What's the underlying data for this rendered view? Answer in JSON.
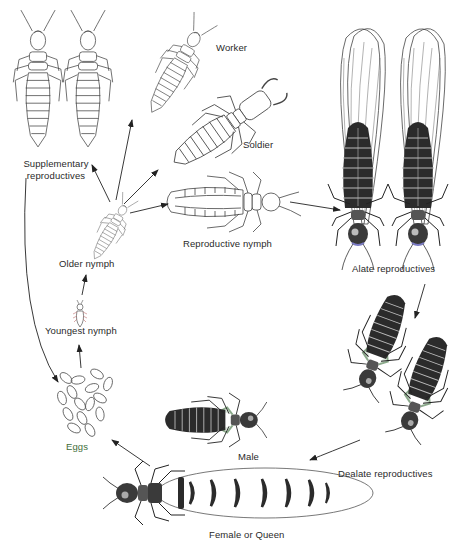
{
  "diagram": {
    "colors": {
      "line": "#333333",
      "dark_body": "#2b2b2b",
      "egg_label": "#3f6e3a",
      "background": "#ffffff"
    },
    "labels": {
      "supplementary_1": "Supplementary",
      "supplementary_2": "reproductives",
      "worker": "Worker",
      "soldier": "Soldier",
      "reproductive_nymph": "Reproductive nymph",
      "older_nymph": "Older nymph",
      "youngest_nymph": "Youngest nymph",
      "eggs": "Eggs",
      "alate": "Alate reproductives",
      "dealate": "Dealate reproductives",
      "male": "Male",
      "queen": "Female or Queen"
    },
    "stages": [
      "Eggs",
      "Youngest nymph",
      "Older nymph",
      "Worker",
      "Soldier",
      "Supplementary reproductives",
      "Reproductive nymph",
      "Alate reproductives",
      "Dealate reproductives",
      "Male",
      "Female or Queen"
    ],
    "transitions": [
      [
        "Eggs",
        "Youngest nymph"
      ],
      [
        "Youngest nymph",
        "Older nymph"
      ],
      [
        "Older nymph",
        "Supplementary reproductives"
      ],
      [
        "Older nymph",
        "Worker"
      ],
      [
        "Older nymph",
        "Soldier"
      ],
      [
        "Older nymph",
        "Reproductive nymph"
      ],
      [
        "Reproductive nymph",
        "Alate reproductives"
      ],
      [
        "Alate reproductives",
        "Dealate reproductives"
      ],
      [
        "Dealate reproductives",
        "Female or Queen"
      ],
      [
        "Female or Queen",
        "Eggs"
      ],
      [
        "Supplementary reproductives",
        "Eggs"
      ]
    ]
  }
}
